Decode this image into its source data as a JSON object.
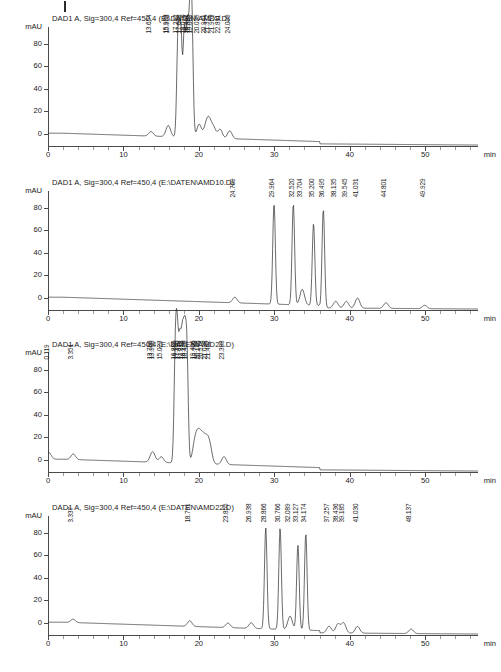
{
  "document": {
    "type": "hplc-chromatogram-report",
    "page_tick_mark": "page-margin-tick"
  },
  "axes": {
    "y_unit": "mAU",
    "y_ticks": [
      0,
      20,
      40,
      60,
      80
    ],
    "y_min": -12,
    "y_max": 95,
    "x_unit": "min",
    "x_ticks": [
      0,
      10,
      20,
      30,
      40,
      50
    ],
    "x_min": 0,
    "x_max": 57
  },
  "chart_data": [
    {
      "type": "line",
      "id": "chromatogram-1",
      "title": "DAD1 A, Sig=300,4 Ref=450,4 (E:\\DATEN\\AMD9.D)",
      "detector": "DAD1 A",
      "signal": "Sig=300,4",
      "reference": "Ref=450,4",
      "datafile": "E:\\DATEN\\AMD9.D",
      "xlabel": "min",
      "ylabel": "mAU",
      "xlim": [
        0,
        57
      ],
      "ylim": [
        -12,
        95
      ],
      "grid": false,
      "legend": "none",
      "peaks": [
        {
          "rt": "13.654",
          "height": 4
        },
        {
          "rt": "15.923",
          "height": 5
        },
        {
          "rt": "15.958",
          "height": 5
        },
        {
          "rt": "17.242",
          "height": 92
        },
        {
          "rt": "17.608",
          "height": 92
        },
        {
          "rt": "18.070",
          "height": 92
        },
        {
          "rt": "18.467",
          "height": 92
        },
        {
          "rt": "18.825",
          "height": 92
        },
        {
          "rt": "19.080",
          "height": 92
        },
        {
          "rt": "20.035",
          "height": 12
        },
        {
          "rt": "20.941",
          "height": 10
        },
        {
          "rt": "21.372",
          "height": 14
        },
        {
          "rt": "21.953",
          "height": 9
        },
        {
          "rt": "22.811",
          "height": 8
        },
        {
          "rt": "24.095",
          "height": 7
        }
      ]
    },
    {
      "type": "line",
      "id": "chromatogram-2",
      "title": "DAD1 A, Sig=300,4 Ref=450,4 (E:\\DATEN\\AMD10.D)",
      "detector": "DAD1 A",
      "signal": "Sig=300,4",
      "reference": "Ref=450,4",
      "datafile": "E:\\DATEN\\AMD10.D",
      "xlabel": "min",
      "ylabel": "mAU",
      "xlim": [
        0,
        57
      ],
      "ylim": [
        -12,
        95
      ],
      "grid": false,
      "legend": "none",
      "peaks": [
        {
          "rt": "24.769",
          "height": 5
        },
        {
          "rt": "29.964",
          "height": 90
        },
        {
          "rt": "32.520",
          "height": 90
        },
        {
          "rt": "33.704",
          "height": 14
        },
        {
          "rt": "35.200",
          "height": 73
        },
        {
          "rt": "36.495",
          "height": 88
        },
        {
          "rt": "38.135",
          "height": 6
        },
        {
          "rt": "39.545",
          "height": 6
        },
        {
          "rt": "41.031",
          "height": 9
        },
        {
          "rt": "44.801",
          "height": 5
        },
        {
          "rt": "49.929",
          "height": 3
        }
      ]
    },
    {
      "type": "line",
      "id": "chromatogram-3",
      "title": "DAD1 A, Sig=300,4 Ref=450,4 (E:\\DATEN\\AMD21.D)",
      "detector": "DAD1 A",
      "signal": "Sig=300,4",
      "reference": "Ref=450,4",
      "datafile": "E:\\DATEN\\AMD21.D",
      "xlabel": "min",
      "ylabel": "mAU",
      "xlim": [
        0,
        57
      ],
      "ylim": [
        -12,
        95
      ],
      "grid": false,
      "legend": "none",
      "peaks": [
        {
          "rt": "0.119",
          "height": 6
        },
        {
          "rt": "3.351",
          "height": 5
        },
        {
          "rt": "13.760",
          "height": 5
        },
        {
          "rt": "13.986",
          "height": 5
        },
        {
          "rt": "15.023",
          "height": 5
        },
        {
          "rt": "16.880",
          "height": 93
        },
        {
          "rt": "17.150",
          "height": 93
        },
        {
          "rt": "17.490",
          "height": 93
        },
        {
          "rt": "17.818",
          "height": 93
        },
        {
          "rt": "18.120",
          "height": 93
        },
        {
          "rt": "18.420",
          "height": 93
        },
        {
          "rt": "19.406",
          "height": 14
        },
        {
          "rt": "19.788",
          "height": 16
        },
        {
          "rt": "20.146",
          "height": 16
        },
        {
          "rt": "20.573",
          "height": 17
        },
        {
          "rt": "21.038",
          "height": 16
        },
        {
          "rt": "21.462",
          "height": 14
        },
        {
          "rt": "23.333",
          "height": 7
        }
      ]
    },
    {
      "type": "line",
      "id": "chromatogram-4",
      "title": "DAD1 A, Sig=300,4 Ref=450,4 (E:\\DATEN\\AMD22.D)",
      "detector": "DAD1 A",
      "signal": "Sig=300,4",
      "reference": "Ref=450,4",
      "datafile": "E:\\DATEN\\AMD22.D",
      "xlabel": "min",
      "ylabel": "mAU",
      "xlim": [
        0,
        57
      ],
      "ylim": [
        -12,
        95
      ],
      "grid": false,
      "legend": "none",
      "peaks": [
        {
          "rt": "3.337",
          "height": 3
        },
        {
          "rt": "18.791",
          "height": 5
        },
        {
          "rt": "23.855",
          "height": 4
        },
        {
          "rt": "26.938",
          "height": 5
        },
        {
          "rt": "28.866",
          "height": 90
        },
        {
          "rt": "30.766",
          "height": 90
        },
        {
          "rt": "32.089",
          "height": 12
        },
        {
          "rt": "33.127",
          "height": 76
        },
        {
          "rt": "34.174",
          "height": 86
        },
        {
          "rt": "37.257",
          "height": 6
        },
        {
          "rt": "38.436",
          "height": 8
        },
        {
          "rt": "39.185",
          "height": 9
        },
        {
          "rt": "41.030",
          "height": 6
        },
        {
          "rt": "48.137",
          "height": 4
        }
      ]
    }
  ]
}
